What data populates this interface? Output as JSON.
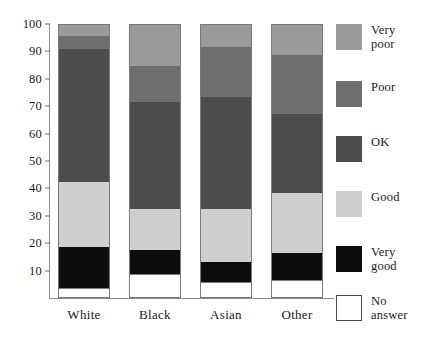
{
  "chart_data": {
    "type": "bar",
    "subtype": "stacked-percentage",
    "title": "",
    "xlabel": "",
    "ylabel": "",
    "ylim": [
      0,
      100
    ],
    "grid": false,
    "legend_position": "right",
    "categories": [
      "White",
      "Black",
      "Asian",
      "Other"
    ],
    "yticks": [
      10,
      20,
      30,
      40,
      50,
      60,
      70,
      80,
      90,
      100
    ],
    "ytick_labels": [
      "10",
      "20",
      "30",
      "40",
      "50",
      "60",
      "70",
      "80",
      "90",
      "100"
    ],
    "series": [
      {
        "name": "No answer",
        "label": "No\nanswer",
        "color": "#ffffff",
        "outlined": true,
        "values": [
          3,
          8,
          5,
          6
        ]
      },
      {
        "name": "Very good",
        "label": "Very\ngood",
        "color": "#0d0d0d",
        "outlined": false,
        "values": [
          15,
          9,
          7.5,
          10
        ]
      },
      {
        "name": "Good",
        "label": "Good",
        "color": "#cfcfcf",
        "outlined": false,
        "values": [
          24,
          15,
          19.5,
          22
        ]
      },
      {
        "name": "OK",
        "label": "OK",
        "color": "#4d4d4d",
        "outlined": false,
        "values": [
          49,
          39.5,
          41.5,
          29
        ]
      },
      {
        "name": "Poor",
        "label": "Poor",
        "color": "#6e6e6e",
        "outlined": false,
        "values": [
          5,
          13.5,
          18.5,
          22
        ]
      },
      {
        "name": "Very poor",
        "label": "Very\npoor",
        "color": "#9a9a9a",
        "outlined": false,
        "values": [
          4,
          15,
          8,
          11
        ]
      }
    ],
    "stack_boundaries": {
      "White": {
        "no_answer": [
          0,
          3
        ],
        "very_good": [
          3,
          18
        ],
        "good": [
          18,
          42
        ],
        "ok": [
          42,
          91
        ],
        "poor": [
          91,
          96
        ],
        "very_poor": [
          96,
          100
        ]
      },
      "Black": {
        "no_answer": [
          0,
          8
        ],
        "very_good": [
          8,
          17
        ],
        "good": [
          17,
          32
        ],
        "ok": [
          32,
          71.5
        ],
        "poor": [
          71.5,
          85
        ],
        "very_poor": [
          85,
          100
        ]
      },
      "Asian": {
        "no_answer": [
          0,
          5
        ],
        "very_good": [
          5,
          12.5
        ],
        "good": [
          12.5,
          32
        ],
        "ok": [
          32,
          73.5
        ],
        "poor": [
          73.5,
          92
        ],
        "very_poor": [
          92,
          100
        ]
      },
      "Other": {
        "no_answer": [
          0,
          6
        ],
        "very_good": [
          6,
          16
        ],
        "good": [
          16,
          38
        ],
        "ok": [
          38,
          67
        ],
        "poor": [
          67,
          89
        ],
        "very_poor": [
          89,
          100
        ]
      }
    }
  }
}
